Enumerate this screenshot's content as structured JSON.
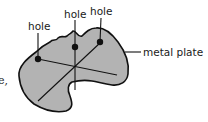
{
  "diagram": {
    "labels": {
      "hole_left": "hole",
      "hole_middle": "hole",
      "hole_right": "hole",
      "plate": "metal plate"
    },
    "text_fragment": "e,",
    "colors": {
      "plate_fill": "#b3b3b3",
      "outline": "#111111",
      "background": "#ffffff"
    }
  }
}
